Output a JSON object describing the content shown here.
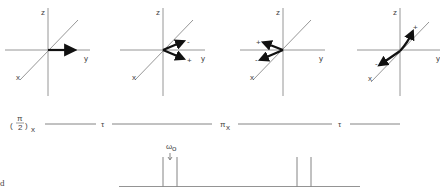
{
  "panels": [
    {
      "axis_labels": {
        "z": "z",
        "y": "y",
        "x": "x"
      },
      "vectors": [
        {
          "label": "",
          "direction": "+y"
        }
      ]
    },
    {
      "axis_labels": {
        "z": "z",
        "y": "y",
        "x": "x"
      },
      "vectors": [
        {
          "label": "-",
          "direction": "up-right"
        },
        {
          "label": "+",
          "direction": "down-right"
        }
      ]
    },
    {
      "axis_labels": {
        "z": "z",
        "y": "y",
        "x": "x"
      },
      "vectors": [
        {
          "label": "+",
          "direction": "up-left"
        },
        {
          "label": "-",
          "direction": "down-left"
        }
      ]
    },
    {
      "axis_labels": {
        "z": "z",
        "y": "y",
        "x": "x"
      },
      "vectors": [
        {
          "label": "+",
          "direction": "along -x (back)"
        },
        {
          "label": "-",
          "direction": "along +x (front)"
        }
      ]
    }
  ],
  "pulse_sequence": {
    "pulse1_num": "π",
    "pulse1_den": "2",
    "pulse1_sub": "x",
    "delay1": "τ",
    "pulse2": "π",
    "pulse2_sub": "x",
    "delay2": "τ"
  },
  "spectrum": {
    "center_label": "ω",
    "center_sub": "o",
    "arrow": "↓",
    "peak_count": 4
  },
  "side_label": "d"
}
